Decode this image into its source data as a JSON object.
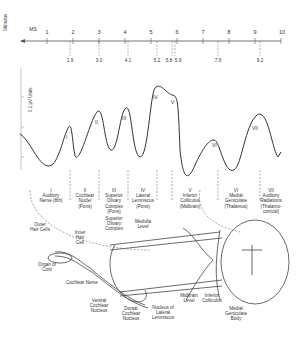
{
  "axis": {
    "stimulus_label": "Stimulus",
    "unit_label": "MS",
    "ticks": [
      "1",
      "2",
      "3",
      "4",
      "5",
      "6",
      "7",
      "8",
      "9",
      "10"
    ],
    "latencies": [
      "1.9",
      "3.0",
      "4.1",
      "5.2",
      "5.8",
      "5.9",
      "7.6",
      "9.2"
    ],
    "amplitude_label": "0.1 µV Units"
  },
  "waves": [
    "I",
    "II",
    "III",
    "IV",
    "V",
    "VI",
    "VII"
  ],
  "generators": [
    {
      "num": "I",
      "lines": [
        "Auditory",
        "Nerve (8th)"
      ]
    },
    {
      "num": "II",
      "lines": [
        "Cochlear",
        "Nuclei",
        "(Pons)"
      ]
    },
    {
      "num": "III",
      "lines": [
        "Superior",
        "Olivary",
        "Complex",
        "(Pons)"
      ]
    },
    {
      "num": "IV",
      "lines": [
        "Lateral",
        "Lemniscus",
        "(Pons)"
      ]
    },
    {
      "num": "V",
      "lines": [
        "Inferior",
        "Colliculus",
        "(Midbrain)"
      ]
    },
    {
      "num": "VI",
      "lines": [
        "Medial",
        "Geniculate",
        "(Thalamus)"
      ]
    },
    {
      "num": "VII",
      "lines": [
        "Auditory",
        "Radiations",
        "(Thalamo-",
        "cortical)"
      ]
    }
  ],
  "anatomy": {
    "outer_hair_cells": "Outer Hair Cells",
    "inner_hair_cell": "Inner Hair Cell",
    "organ_of_corti": "Organ of Corti",
    "cochlear_nerve": "Cochlear Nerve",
    "superior_olivary": "Superior Olivary Complex",
    "medulla_level": "Medulla Level",
    "ventral_cochlear": "Ventral Cochlear Nucleus",
    "dorsal_cochlear": "Dorsal Cochlear Nucleus",
    "nucleus_lateral_lemniscus": "Nucleus of Lateral Lemniscus",
    "midbrain_level": "Midbrain Level",
    "inferior_colliculus": "Inferior Colliculus",
    "medial_geniculate_body": "Medial Geniculate Body"
  }
}
